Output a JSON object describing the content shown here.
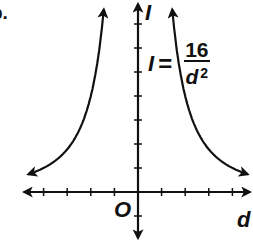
{
  "figure": {
    "part_label": "b.",
    "y_axis_label": "I",
    "x_axis_label": "d",
    "origin_label": "O",
    "equation": {
      "lhs": "I",
      "equals": "=",
      "numerator": "16",
      "denominator_var": "d",
      "denominator_exp": "2"
    },
    "colors": {
      "ink": "#111111",
      "background": "#ffffff"
    }
  },
  "chart_data": {
    "type": "line",
    "title": "",
    "function": "I = 16 / d^2",
    "xlabel": "d",
    "ylabel": "I",
    "origin_label": "O",
    "xlim": [
      -4.7,
      4.7
    ],
    "ylim": [
      -2,
      7.8
    ],
    "x_ticks": [
      -4,
      -3,
      -2,
      -1,
      1,
      2,
      3,
      4
    ],
    "y_ticks": [
      -1,
      1,
      2,
      3,
      4,
      5,
      6,
      7
    ],
    "tick_labels_shown": false,
    "grid": false,
    "axes_with_arrows": true,
    "series": [
      {
        "name": "left branch (d < 0)",
        "x": [
          -4.5,
          -4,
          -3,
          -2.5,
          -2,
          -1.8,
          -1.6,
          -1.5
        ],
        "values": [
          0.79,
          1,
          1.78,
          2.56,
          4,
          4.94,
          6.25,
          7.11
        ]
      },
      {
        "name": "right branch (d > 0)",
        "x": [
          1.5,
          1.6,
          1.8,
          2,
          2.5,
          3,
          4,
          4.5
        ],
        "values": [
          7.11,
          6.25,
          4.94,
          4,
          2.56,
          1.78,
          1,
          0.79
        ]
      }
    ],
    "annotations": [
      {
        "text": "I = 16/d²",
        "position": "upper right of y-axis, beside right branch"
      }
    ]
  }
}
